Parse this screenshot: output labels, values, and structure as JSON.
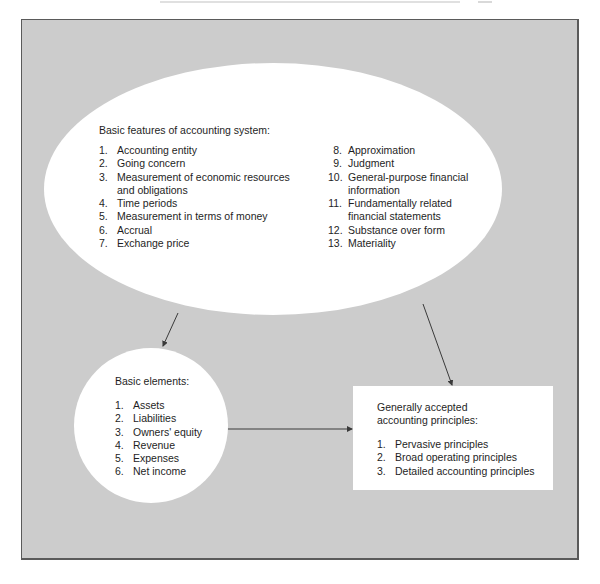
{
  "figure": {
    "background_color": "#cccccc",
    "shape_fill": "#ffffff",
    "border_color": "#5a5a5a",
    "line_color": "#3a3a3a"
  },
  "features": {
    "title": "Basic features of accounting system:",
    "left_items": [
      {
        "num": "1.",
        "label": "Accounting entity"
      },
      {
        "num": "2.",
        "label": "Going concern"
      },
      {
        "num": "3.",
        "label": "Measurement of economic resources\nand obligations"
      },
      {
        "num": "4.",
        "label": "Time periods"
      },
      {
        "num": "5.",
        "label": "Measurement in terms of money"
      },
      {
        "num": "6.",
        "label": "Accrual"
      },
      {
        "num": "7.",
        "label": "Exchange price"
      }
    ],
    "right_items": [
      {
        "num": "8.",
        "label": "Approximation"
      },
      {
        "num": "9.",
        "label": "Judgment"
      },
      {
        "num": "10.",
        "label": "General-purpose financial\ninformation"
      },
      {
        "num": "11.",
        "label": "Fundamentally related\nfinancial statements"
      },
      {
        "num": "12.",
        "label": "Substance over form"
      },
      {
        "num": "13.",
        "label": "Materiality"
      }
    ]
  },
  "elements": {
    "title": "Basic elements:",
    "items": [
      {
        "num": "1.",
        "label": "Assets"
      },
      {
        "num": "2.",
        "label": "Liabilities"
      },
      {
        "num": "3.",
        "label": "Owners' equity"
      },
      {
        "num": "4.",
        "label": "Revenue"
      },
      {
        "num": "5.",
        "label": "Expenses"
      },
      {
        "num": "6.",
        "label": "Net income"
      }
    ]
  },
  "gaap": {
    "title": "Generally accepted\naccounting principles:",
    "items": [
      {
        "num": "1.",
        "label": "Pervasive principles"
      },
      {
        "num": "2.",
        "label": "Broad operating principles"
      },
      {
        "num": "3.",
        "label": "Detailed accounting principles"
      }
    ]
  },
  "connectors": [
    {
      "from": "features",
      "to": "elements"
    },
    {
      "from": "features",
      "to": "gaap"
    },
    {
      "from": "elements",
      "to": "gaap"
    }
  ]
}
